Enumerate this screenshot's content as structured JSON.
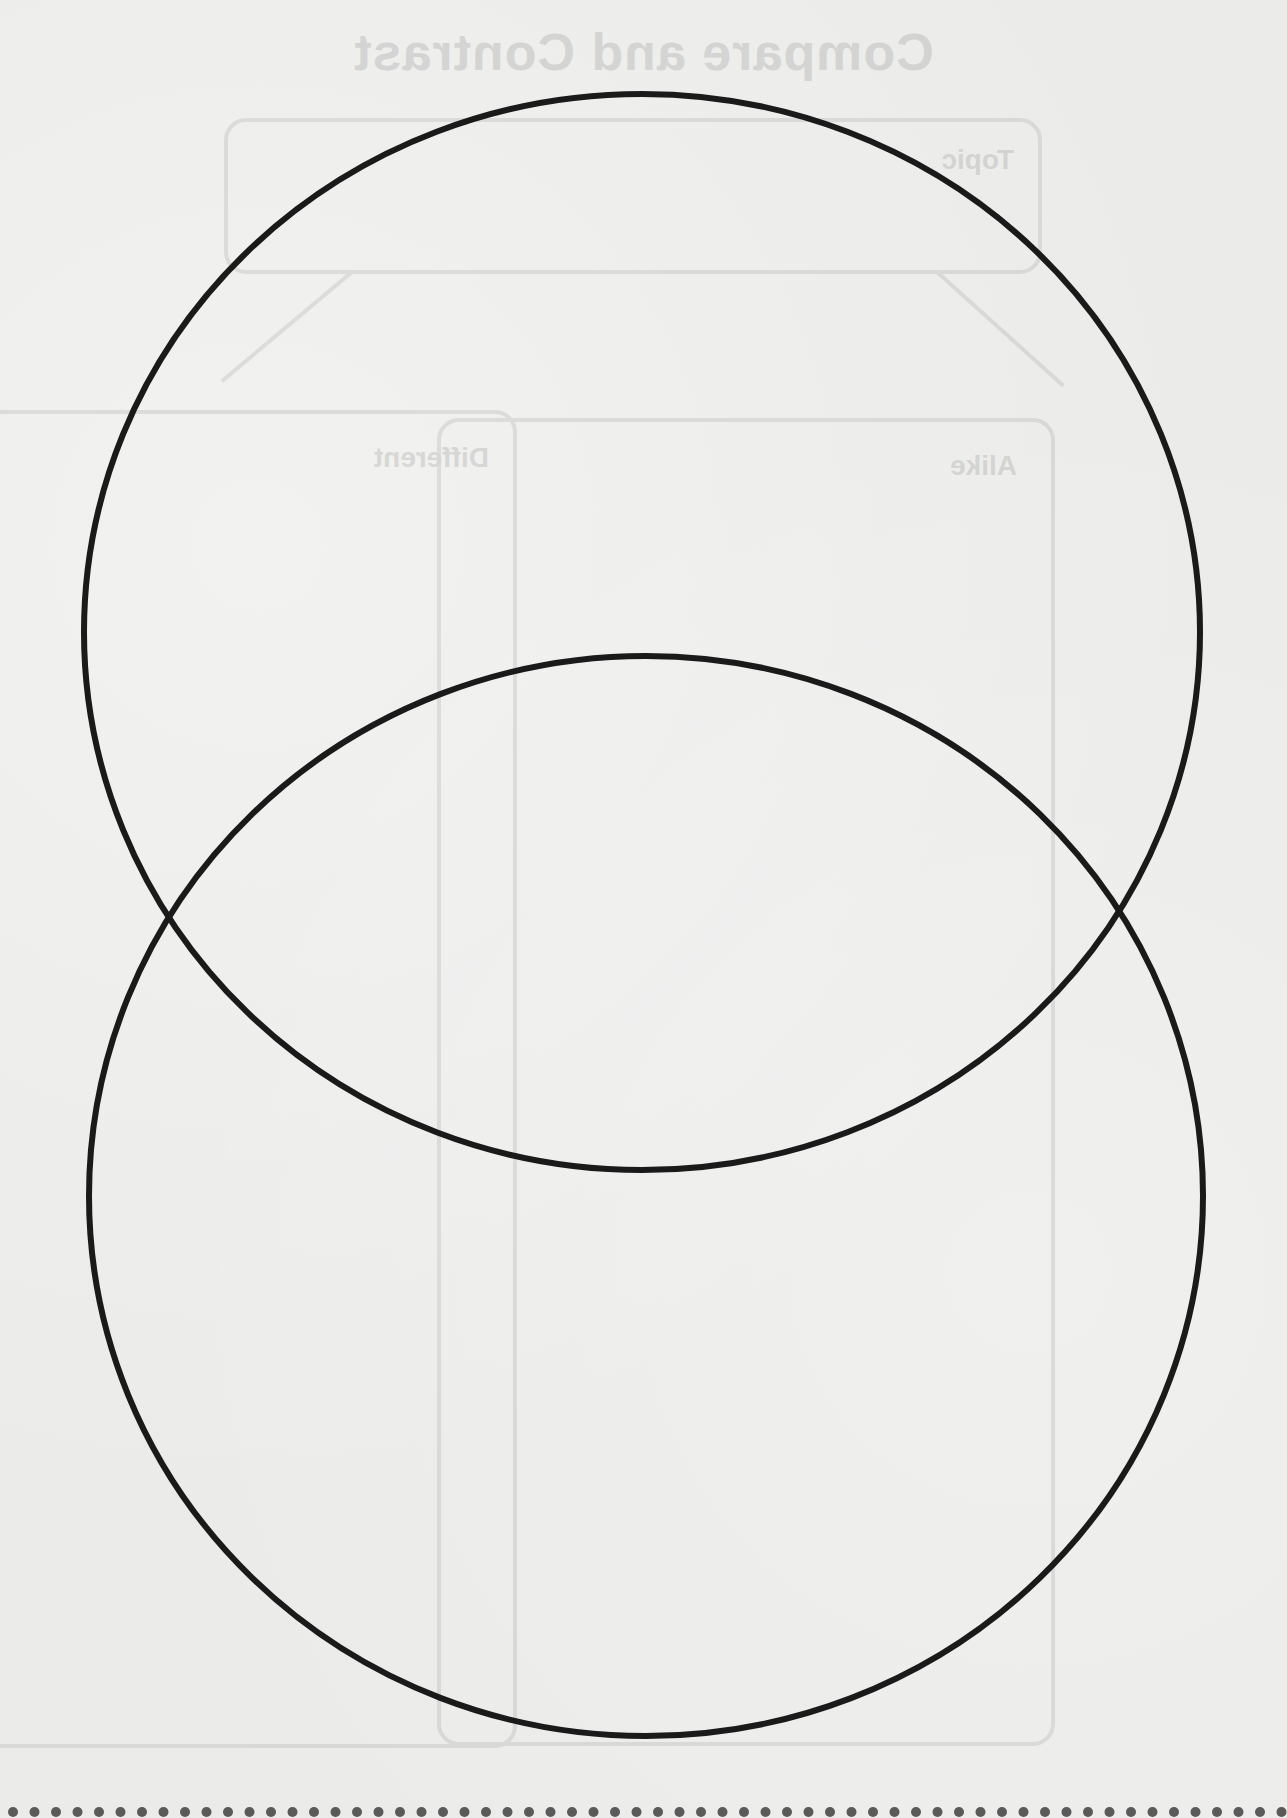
{
  "worksheet": {
    "type": "venn-diagram",
    "circle_count": 2,
    "circle_stroke_color": "#1a1a1a",
    "paper_color": "#ebebe9",
    "circles": [
      {
        "name": "top-circle",
        "cx": 642,
        "cy": 632,
        "rx": 558,
        "ry": 538
      },
      {
        "name": "bottom-circle",
        "cx": 646,
        "cy": 1196,
        "rx": 557,
        "ry": 540
      }
    ]
  },
  "bleed_through": {
    "note": "mirrored text visible through paper from reverse side",
    "title": "Compare and Contrast",
    "topic_label": "Topic",
    "left_column_label": "Different",
    "right_column_label": "Alike"
  },
  "perforation": {
    "dot_color": "#5a5a5a",
    "dot_spacing": 21.5,
    "dot_count": 60
  }
}
